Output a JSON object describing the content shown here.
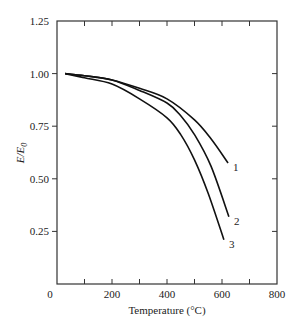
{
  "chart_data": {
    "type": "line",
    "title": "",
    "xlabel": "Temperature (°C)",
    "ylabel": "E/E0",
    "ylabel_main": "E/E",
    "ylabel_sub": "0",
    "xlim": [
      0,
      800
    ],
    "ylim": [
      0,
      1.25
    ],
    "x_ticks": [
      0,
      200,
      400,
      600,
      800
    ],
    "x_tick_labels": [
      "0",
      "200",
      "400",
      "600",
      "800"
    ],
    "x_minor_ticks": [
      100,
      300,
      500,
      700
    ],
    "y_ticks": [
      0.25,
      0.5,
      0.75,
      1.0,
      1.25
    ],
    "y_tick_labels": [
      "0.25",
      "0.50",
      "0.75",
      "1.00",
      "1.25"
    ],
    "grid": false,
    "legend": "inline labels at curve ends",
    "series": [
      {
        "name": "1",
        "x": [
          30,
          100,
          200,
          300,
          400,
          500,
          560,
          622
        ],
        "y": [
          1.0,
          0.99,
          0.97,
          0.93,
          0.88,
          0.78,
          0.69,
          0.575
        ]
      },
      {
        "name": "2",
        "x": [
          30,
          100,
          200,
          300,
          400,
          450,
          500,
          560,
          625
        ],
        "y": [
          1.0,
          0.99,
          0.97,
          0.92,
          0.86,
          0.8,
          0.71,
          0.56,
          0.32
        ]
      },
      {
        "name": "3",
        "x": [
          30,
          100,
          200,
          300,
          400,
          450,
          500,
          550,
          607
        ],
        "y": [
          1.0,
          0.98,
          0.95,
          0.88,
          0.79,
          0.71,
          0.59,
          0.43,
          0.21
        ]
      }
    ]
  },
  "colors": {
    "axis": "#333333",
    "curve": "#111111",
    "text": "#222222"
  }
}
